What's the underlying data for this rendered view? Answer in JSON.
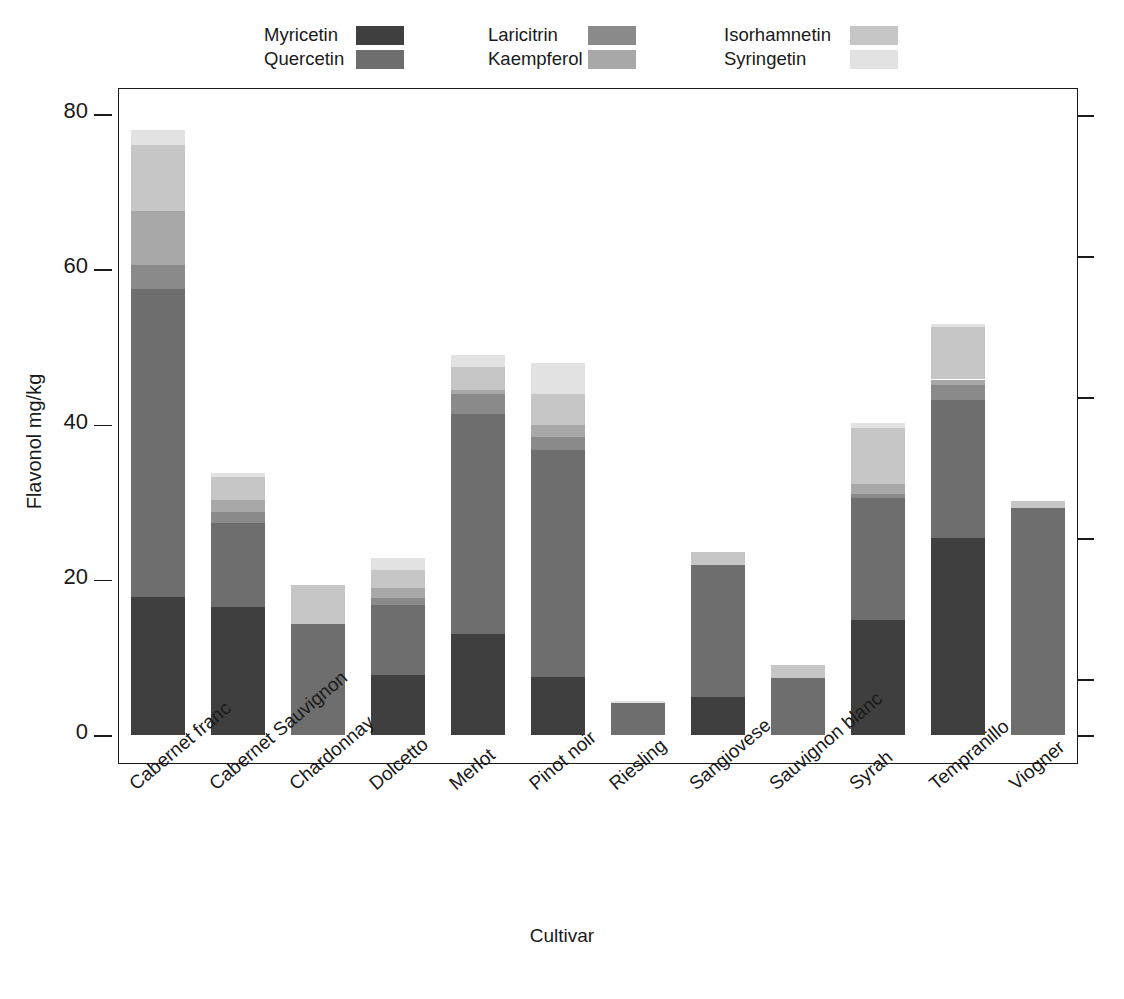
{
  "chart_data": {
    "type": "bar",
    "stacked": true,
    "title": "",
    "xlabel": "Cultivar",
    "ylabel": "Flavonol mg/kg",
    "ylim": [
      0,
      80
    ],
    "yticks": [
      0,
      20,
      40,
      60,
      80
    ],
    "grid": false,
    "legend_position": "top",
    "categories": [
      "Cabernet franc",
      "Cabernet Sauvignon",
      "Chardonnay",
      "Dolcetto",
      "Merlot",
      "Pinot noir",
      "Riesling",
      "Sangiovese",
      "Sauvignon blanc",
      "Syrah",
      "Tempranillo",
      "Viogner"
    ],
    "series": [
      {
        "name": "Myricetin",
        "color": "#3f3f3f",
        "values": [
          17.8,
          16.5,
          0.0,
          7.7,
          13.0,
          7.5,
          0.0,
          4.9,
          0.0,
          14.8,
          25.4,
          0.0
        ]
      },
      {
        "name": "Quercetin",
        "color": "#6e6e6e",
        "values": [
          39.7,
          10.8,
          14.3,
          9.0,
          28.4,
          29.2,
          4.1,
          17.0,
          7.3,
          15.7,
          17.8,
          29.3
        ]
      },
      {
        "name": "Laricitrin",
        "color": "#8a8a8a",
        "values": [
          3.0,
          1.4,
          0.0,
          1.0,
          2.5,
          1.7,
          0.0,
          0.0,
          0.0,
          0.6,
          1.9,
          0.0
        ]
      },
      {
        "name": "Kaempferol",
        "color": "#a8a8a8",
        "values": [
          7.0,
          1.6,
          0.0,
          1.3,
          0.5,
          1.5,
          0.0,
          0.0,
          0.0,
          1.2,
          0.7,
          0.0
        ]
      },
      {
        "name": "Isorhamnetin",
        "color": "#c6c6c6",
        "values": [
          8.5,
          2.9,
          5.0,
          2.2,
          3.0,
          4.0,
          0.0,
          1.7,
          1.7,
          7.2,
          6.8,
          0.9
        ]
      },
      {
        "name": "Syringetin",
        "color": "#e2e2e2",
        "values": [
          2.0,
          0.6,
          0.0,
          1.6,
          1.6,
          4.0,
          0.3,
          0.0,
          0.0,
          0.7,
          0.4,
          0.0
        ]
      }
    ],
    "bar_totals": [
      78.0,
      33.8,
      19.3,
      22.8,
      49.0,
      47.9,
      4.4,
      23.6,
      9.0,
      40.2,
      53.0,
      30.2
    ]
  },
  "legend": {
    "columns": [
      {
        "entries": [
          {
            "label": "Myricetin",
            "color": "#3f3f3f",
            "swatch": "legend-swatch-myricetin"
          },
          {
            "label": "Quercetin",
            "color": "#6e6e6e",
            "swatch": "legend-swatch-quercetin"
          }
        ]
      },
      {
        "entries": [
          {
            "label": "Laricitrin",
            "color": "#8a8a8a",
            "swatch": "legend-swatch-laricitrin"
          },
          {
            "label": "Kaempferol",
            "color": "#a8a8a8",
            "swatch": "legend-swatch-kaempferol"
          }
        ]
      },
      {
        "entries": [
          {
            "label": "Isorhamnetin",
            "color": "#c6c6c6",
            "swatch": "legend-swatch-isorhamnetin"
          },
          {
            "label": "Syringetin",
            "color": "#e2e2e2",
            "swatch": "legend-swatch-syringetin"
          }
        ]
      }
    ]
  },
  "axes": {
    "y_title": "Flavonol mg/kg",
    "x_title": "Cultivar",
    "y_tick_labels": [
      "0",
      "20",
      "40",
      "60",
      "80"
    ]
  },
  "colors": {
    "axis": "#1a1a1a",
    "background": "#ffffff",
    "bar_gap": "#ffffff"
  }
}
